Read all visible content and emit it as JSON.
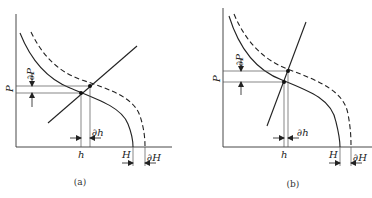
{
  "figure": {
    "panels": [
      {
        "caption": "(a)",
        "y_axis_label": "P",
        "labels": {
          "dP": "∂P",
          "h": "h",
          "dh": "∂h",
          "H": "H",
          "dH": "∂H"
        },
        "description": "Operating line with positive slope intersecting solid and dashed P-H curves"
      },
      {
        "caption": "(b)",
        "y_axis_label": "P",
        "labels": {
          "dP": "∂P",
          "h": "h",
          "dh": "∂h",
          "H": "H",
          "dH": "∂H"
        },
        "description": "Steep operating line intersecting solid and dashed P-H curves"
      }
    ],
    "colors": {
      "line": "#222222",
      "guide": "#555555",
      "background": "#ffffff"
    }
  }
}
